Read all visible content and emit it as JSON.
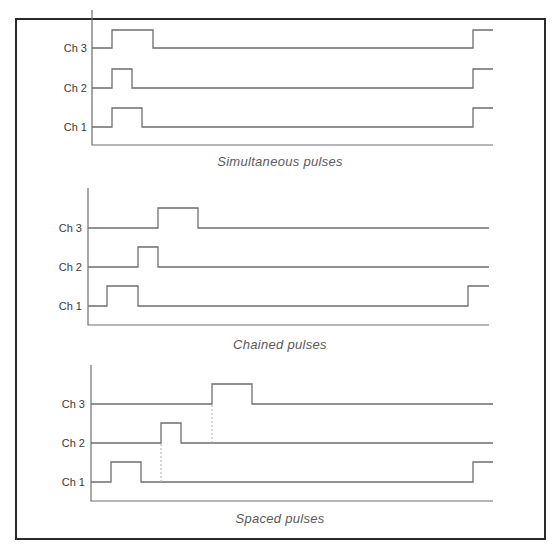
{
  "diagram": {
    "frame": {
      "x": 16,
      "y": 19,
      "w": 529,
      "h": 520,
      "color": "#2a2a2a"
    },
    "line_color": "#6e6e6e",
    "dash_color": "#b0b0b0",
    "panels": [
      {
        "caption": "Simultaneous pulses",
        "caption_pos": [
          280,
          166
        ],
        "axis": {
          "x": 92,
          "top": 10,
          "bottom": 145,
          "right": 493
        },
        "channels": [
          {
            "label": "Ch 3",
            "base": 48,
            "high": 30,
            "pulses": [
              [
                112,
                153
              ],
              [
                473,
                null
              ]
            ]
          },
          {
            "label": "Ch 2",
            "base": 88,
            "high": 69,
            "pulses": [
              [
                112,
                132
              ],
              [
                473,
                null
              ]
            ]
          },
          {
            "label": "Ch 1",
            "base": 127,
            "high": 108,
            "pulses": [
              [
                112,
                142
              ],
              [
                473,
                null
              ]
            ]
          }
        ],
        "dashes": []
      },
      {
        "caption": "Chained pulses",
        "caption_pos": [
          280,
          349
        ],
        "axis": {
          "x": 88,
          "top": 188,
          "bottom": 325,
          "right": 489
        },
        "channels": [
          {
            "label": "Ch 3",
            "base": 228,
            "high": 208,
            "pulses": [
              [
                158,
                198
              ]
            ]
          },
          {
            "label": "Ch 2",
            "base": 267,
            "high": 247,
            "pulses": [
              [
                138,
                158
              ]
            ]
          },
          {
            "label": "Ch 1",
            "base": 306,
            "high": 286,
            "pulses": [
              [
                107,
                138
              ],
              [
                468,
                null
              ]
            ]
          }
        ],
        "dashes": []
      },
      {
        "caption": "Spaced pulses",
        "caption_pos": [
          280,
          523
        ],
        "axis": {
          "x": 91,
          "top": 365,
          "bottom": 501,
          "right": 493
        },
        "channels": [
          {
            "label": "Ch 3",
            "base": 404,
            "high": 384,
            "pulses": [
              [
                212,
                252
              ]
            ]
          },
          {
            "label": "Ch 2",
            "base": 443,
            "high": 423,
            "pulses": [
              [
                161,
                181
              ]
            ]
          },
          {
            "label": "Ch 1",
            "base": 482,
            "high": 462,
            "pulses": [
              [
                111,
                141
              ],
              [
                473,
                null
              ]
            ]
          }
        ],
        "dashes": [
          {
            "x": 161,
            "y1": 482,
            "y2": 443
          },
          {
            "x": 212,
            "y1": 443,
            "y2": 404
          }
        ]
      }
    ]
  }
}
